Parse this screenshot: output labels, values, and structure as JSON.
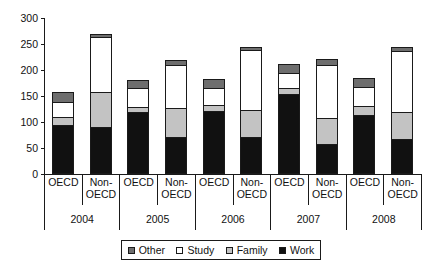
{
  "chart_data": {
    "type": "bar",
    "subtype": "stacked",
    "title": "",
    "xlabel": "",
    "ylabel": "",
    "ylim": [
      0,
      300
    ],
    "yticks": [
      0,
      50,
      100,
      150,
      200,
      250,
      300
    ],
    "grid": false,
    "legend_position": "bottom",
    "groups": [
      "2004",
      "2005",
      "2006",
      "2007",
      "2008"
    ],
    "subcategories": [
      "OECD",
      "Non-OECD"
    ],
    "categories": [
      "2004 OECD",
      "2004 Non-OECD",
      "2005 OECD",
      "2005 Non-OECD",
      "2006 OECD",
      "2006 Non-OECD",
      "2007 OECD",
      "2007 Non-OECD",
      "2008 OECD",
      "2008 Non-OECD"
    ],
    "series": [
      {
        "name": "Work",
        "color": "#111111",
        "values": [
          92,
          88,
          117,
          70,
          119,
          70,
          152,
          55,
          112,
          66
        ]
      },
      {
        "name": "Family",
        "color": "#c3c3c3",
        "values": [
          16,
          67,
          10,
          55,
          11,
          52,
          11,
          50,
          16,
          52
        ]
      },
      {
        "name": "Study",
        "color": "#ffffff",
        "values": [
          28,
          107,
          36,
          82,
          33,
          114,
          29,
          103,
          37,
          117
        ]
      },
      {
        "name": "Other",
        "color": "#6e6e6e",
        "values": [
          20,
          6,
          16,
          11,
          18,
          6,
          18,
          12,
          18,
          7
        ]
      }
    ],
    "totals": [
      156,
      268,
      179,
      218,
      181,
      242,
      210,
      220,
      183,
      242
    ]
  },
  "axis": {
    "y_tick_labels": [
      "300",
      "250",
      "200",
      "150",
      "100",
      "50",
      "0"
    ]
  },
  "legend": {
    "items": [
      {
        "label": "Other",
        "swatch": "other-swatch"
      },
      {
        "label": "Study",
        "swatch": "study-swatch"
      },
      {
        "label": "Family",
        "swatch": "family-swatch"
      },
      {
        "label": "Work",
        "swatch": "work-swatch"
      }
    ]
  },
  "x_axis_cells": [
    {
      "label": "OECD"
    },
    {
      "label": "Non-\nOECD"
    },
    {
      "label": "OECD"
    },
    {
      "label": "Non-\nOECD"
    },
    {
      "label": "OECD"
    },
    {
      "label": "Non-\nOECD"
    },
    {
      "label": "OECD"
    },
    {
      "label": "Non-\nOECD"
    },
    {
      "label": "OECD"
    },
    {
      "label": "Non-\nOECD"
    }
  ],
  "year_cells": [
    {
      "label": "2004"
    },
    {
      "label": "2005"
    },
    {
      "label": "2006"
    },
    {
      "label": "2007"
    },
    {
      "label": "2008"
    }
  ]
}
